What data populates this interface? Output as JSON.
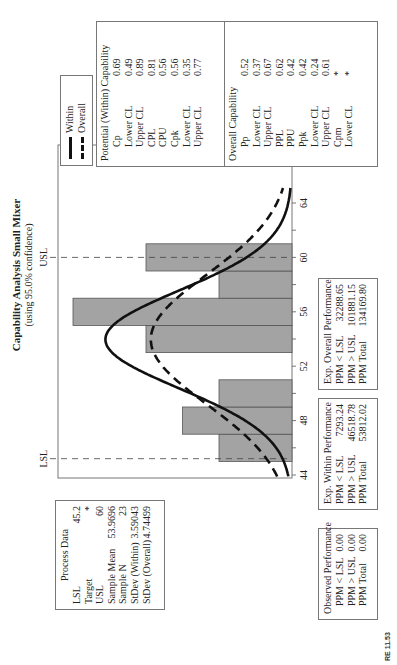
{
  "title": {
    "main": "Capability Analysis Small Mixer",
    "sub": "(using 95.0% confidence)"
  },
  "legend": {
    "items": [
      {
        "label": "Within",
        "style": "solid"
      },
      {
        "label": "Overall",
        "style": "dashed"
      }
    ]
  },
  "process_data": {
    "header": "Process Data",
    "rows": [
      {
        "k": "LSL",
        "v": "45.2"
      },
      {
        "k": "Target",
        "v": "*"
      },
      {
        "k": "USL",
        "v": "60"
      },
      {
        "k": "Sample Mean",
        "v": "53.9696"
      },
      {
        "k": "Sample N",
        "v": "23"
      },
      {
        "k": "StDev (Within)",
        "v": "3.59043"
      },
      {
        "k": "StDev (Overall)",
        "v": "4.74499"
      }
    ]
  },
  "potential_capability": {
    "header": "Potential (Within) Capability",
    "rows": [
      {
        "k": "Cp",
        "v": "0.69"
      },
      {
        "k": "Lower CL",
        "v": "0.49"
      },
      {
        "k": "Upper CL",
        "v": "0.89"
      },
      {
        "k": "CPL",
        "v": "0.81"
      },
      {
        "k": "CPU",
        "v": "0.56"
      },
      {
        "k": "Cpk",
        "v": "0.56"
      },
      {
        "k": "Lower CL",
        "v": "0.35"
      },
      {
        "k": "Upper CL",
        "v": "0.77"
      }
    ]
  },
  "overall_capability": {
    "header": "Overall Capability",
    "rows": [
      {
        "k": "Pp",
        "v": "0.52"
      },
      {
        "k": "Lower CL",
        "v": "0.37"
      },
      {
        "k": "Upper CL",
        "v": "0.67"
      },
      {
        "k": "PPL",
        "v": "0.62"
      },
      {
        "k": "PPU",
        "v": "0.42"
      },
      {
        "k": "Ppk",
        "v": "0.42"
      },
      {
        "k": "Lower CL",
        "v": "0.24"
      },
      {
        "k": "Upper CL",
        "v": "0.61"
      },
      {
        "k": "Cpm",
        "v": "*"
      },
      {
        "k": "Lower CL",
        "v": "*"
      }
    ]
  },
  "observed_performance": {
    "header": "Observed Performance",
    "rows": [
      {
        "k": "PPM < LSL",
        "v": "0.00"
      },
      {
        "k": "PPM > USL",
        "v": "0.00"
      },
      {
        "k": "PPM Total",
        "v": "0.00"
      }
    ]
  },
  "exp_within_performance": {
    "header": "Exp. Within Performance",
    "rows": [
      {
        "k": "PPM < LSL",
        "v": "7293.24"
      },
      {
        "k": "PPM > USL",
        "v": "46518.78"
      },
      {
        "k": "PPM Total",
        "v": "53812.02"
      }
    ]
  },
  "exp_overall_performance": {
    "header": "Exp. Overall Performance",
    "rows": [
      {
        "k": "PPM < LSL",
        "v": "32288.65"
      },
      {
        "k": "PPM > USL",
        "v": "101881.15"
      },
      {
        "k": "PPM Total",
        "v": "134169.80"
      }
    ]
  },
  "spec_labels": {
    "lsl": "LSL",
    "usl": "USL"
  },
  "corner_label": "RE 11.53",
  "colors": {
    "bar_fill": "#a3a3a3",
    "bar_stroke": "#555555",
    "curve": "#111111",
    "frame": "#777777"
  },
  "chart_data": {
    "type": "bar",
    "title": "Capability Analysis Small Mixer",
    "subtitle": "(using 95.0% confidence)",
    "xlabel": "",
    "ylabel": "",
    "bin_edges": [
      45,
      47,
      49,
      51,
      53,
      55,
      57,
      59,
      61
    ],
    "categories": [
      "45-47",
      "47-49",
      "49-51",
      "51-53",
      "53-55",
      "55-57",
      "57-59",
      "59-61"
    ],
    "values": [
      2,
      3,
      2,
      0,
      4,
      6,
      2,
      4
    ],
    "xlim": [
      43.8,
      65.3
    ],
    "xticks": [
      44,
      46,
      48,
      50,
      52,
      54,
      56,
      58,
      60,
      62,
      64
    ],
    "xtick_labels": [
      "44",
      "48",
      "52",
      "56",
      "60",
      "64"
    ],
    "spec_limits": {
      "LSL": 45.2,
      "USL": 60
    },
    "series": [
      {
        "name": "Within",
        "type": "normal-curve",
        "mean": 53.9696,
        "sd": 3.59043,
        "style": "solid"
      },
      {
        "name": "Overall",
        "type": "normal-curve",
        "mean": 53.9696,
        "sd": 4.74499,
        "style": "dashed"
      }
    ],
    "n": 23,
    "grid": false,
    "legend_position": "top-right"
  }
}
